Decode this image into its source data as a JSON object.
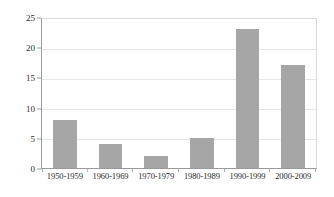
{
  "chart_data": {
    "type": "bar",
    "title": "",
    "subtitle": "",
    "xlabel": "",
    "ylabel": "",
    "categories": [
      "1950-1959",
      "1960-1969",
      "1970-1979",
      "1980-1989",
      "1990-1999",
      "2000-2009"
    ],
    "values": [
      8,
      4,
      2,
      5,
      23,
      17
    ],
    "ylim": [
      0,
      25
    ],
    "yticks": [
      0,
      5,
      10,
      15,
      20,
      25
    ],
    "ytick_labels": [
      "0",
      "5",
      "10",
      "15",
      "20",
      "25"
    ],
    "grid": true,
    "grid_axis": "y",
    "legend": false,
    "legend_position": "none",
    "series": [
      {
        "name": "",
        "values": [
          8,
          4,
          2,
          5,
          23,
          17
        ]
      }
    ],
    "colors": {
      "bar_fill": "#a6a6a6",
      "gridline": "#e6e6e6",
      "axis_line": "#9a9a9a",
      "plot_border": "#d9d9d9",
      "text": "#2b2b2b",
      "background": "#ffffff"
    }
  }
}
